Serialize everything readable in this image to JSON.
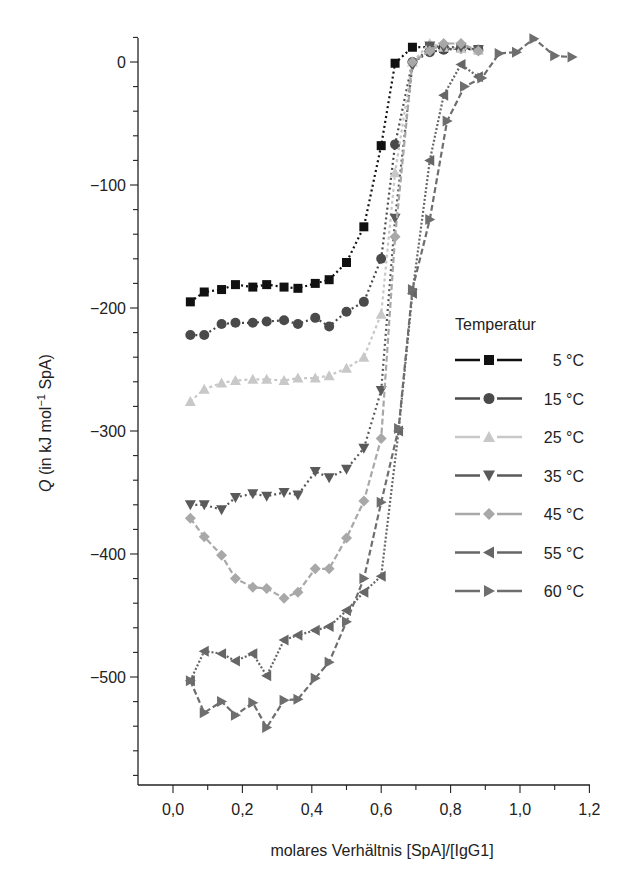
{
  "chart_data": {
    "type": "line",
    "title": "",
    "xlabel": "molares Verhältnis [SpA]/[IgG1]",
    "ylabel": "Q (in kJ mol⁻¹ SpA)",
    "ylabel_italic": "Q",
    "ylabel_rest": " (in kJ mol",
    "ylabel_sup": "−1",
    "ylabel_tail": " SpA)",
    "xlim": [
      -0.1,
      1.2
    ],
    "ylim": [
      -580,
      20
    ],
    "xticks": [
      0.0,
      0.2,
      0.4,
      0.6,
      0.8,
      1.0,
      1.2
    ],
    "xtick_labels": [
      "0,0",
      "0,2",
      "0,4",
      "0,6",
      "0,8",
      "1,0",
      "1,2"
    ],
    "yticks": [
      0,
      -100,
      -200,
      -300,
      -400,
      -500
    ],
    "ytick_labels": [
      "0",
      "−100",
      "−200",
      "−300",
      "−400",
      "−500"
    ],
    "grid": false,
    "legend_title": "Temperatur",
    "legend_position": "right-middle",
    "series": [
      {
        "name": "5 °C",
        "marker": "square",
        "color": "#111111",
        "dash": "2,3",
        "x": [
          0.05,
          0.09,
          0.14,
          0.18,
          0.23,
          0.27,
          0.32,
          0.36,
          0.41,
          0.45,
          0.5,
          0.55,
          0.6,
          0.64,
          0.69,
          0.74,
          0.78,
          0.83,
          0.88
        ],
        "y": [
          -195,
          -187,
          -185,
          -181,
          -183,
          -181,
          -183,
          -184,
          -180,
          -177,
          -163,
          -134,
          -68,
          -1,
          12,
          12,
          11,
          11,
          10
        ]
      },
      {
        "name": "15 °C",
        "marker": "circle",
        "color": "#4a4a4a",
        "dash": "2,3",
        "x": [
          0.05,
          0.09,
          0.14,
          0.18,
          0.23,
          0.27,
          0.32,
          0.36,
          0.41,
          0.45,
          0.5,
          0.55,
          0.6,
          0.64,
          0.69,
          0.74,
          0.78,
          0.83,
          0.88
        ],
        "y": [
          -222,
          -222,
          -213,
          -212,
          -212,
          -211,
          -210,
          -213,
          -208,
          -215,
          -203,
          -195,
          -160,
          -67,
          0,
          8,
          10,
          11,
          10
        ]
      },
      {
        "name": "25 °C",
        "marker": "triangle-up",
        "color": "#c8c8c8",
        "dash": "3,3",
        "x": [
          0.05,
          0.09,
          0.14,
          0.18,
          0.23,
          0.27,
          0.32,
          0.36,
          0.41,
          0.45,
          0.5,
          0.55,
          0.6,
          0.64,
          0.69,
          0.74,
          0.78,
          0.83,
          0.88
        ],
        "y": [
          -276,
          -266,
          -261,
          -259,
          -258,
          -258,
          -259,
          -257,
          -257,
          -255,
          -249,
          -240,
          -205,
          -90,
          0,
          15,
          12,
          11,
          10
        ]
      },
      {
        "name": "35 °C",
        "marker": "triangle-down",
        "color": "#5a5a5a",
        "dash": "2,3",
        "x": [
          0.05,
          0.09,
          0.14,
          0.18,
          0.23,
          0.27,
          0.32,
          0.36,
          0.41,
          0.45,
          0.5,
          0.55,
          0.6,
          0.64,
          0.69,
          0.74,
          0.78,
          0.83,
          0.88
        ],
        "y": [
          -360,
          -360,
          -364,
          -354,
          -351,
          -353,
          -350,
          -352,
          -333,
          -338,
          -331,
          -314,
          -267,
          -127,
          -3,
          13,
          12,
          12,
          10
        ]
      },
      {
        "name": "45 °C",
        "marker": "diamond",
        "color": "#a8a8a8",
        "dash": "6,3",
        "x": [
          0.05,
          0.09,
          0.14,
          0.18,
          0.23,
          0.27,
          0.32,
          0.36,
          0.41,
          0.45,
          0.5,
          0.55,
          0.6,
          0.64,
          0.69,
          0.74,
          0.78,
          0.83,
          0.88
        ],
        "y": [
          -371,
          -386,
          -401,
          -420,
          -427,
          -428,
          -436,
          -431,
          -412,
          -412,
          -387,
          -357,
          -306,
          -142,
          0,
          9,
          15,
          15,
          9
        ]
      },
      {
        "name": "55 °C",
        "marker": "triangle-left",
        "color": "#666666",
        "dash": "2,2",
        "x": [
          0.05,
          0.09,
          0.14,
          0.18,
          0.23,
          0.27,
          0.32,
          0.36,
          0.41,
          0.45,
          0.5,
          0.55,
          0.6,
          0.65,
          0.69,
          0.74,
          0.78,
          0.83,
          0.88
        ],
        "y": [
          -503,
          -479,
          -481,
          -487,
          -481,
          -499,
          -470,
          -466,
          -462,
          -459,
          -446,
          -431,
          -418,
          -300,
          -188,
          -80,
          -27,
          -2,
          -12
        ]
      },
      {
        "name": "60 °C",
        "marker": "triangle-right",
        "color": "#6e6e6e",
        "dash": "6,3",
        "x": [
          0.05,
          0.09,
          0.14,
          0.18,
          0.23,
          0.27,
          0.32,
          0.36,
          0.41,
          0.45,
          0.5,
          0.55,
          0.6,
          0.65,
          0.69,
          0.74,
          0.79,
          0.84,
          0.89,
          0.94,
          0.99,
          1.04,
          1.1,
          1.15
        ],
        "y": [
          -503,
          -529,
          -520,
          -531,
          -521,
          -541,
          -519,
          -518,
          -501,
          -488,
          -455,
          -420,
          -358,
          -298,
          -185,
          -128,
          -48,
          -20,
          -13,
          7,
          8,
          19,
          5,
          4
        ]
      }
    ]
  }
}
